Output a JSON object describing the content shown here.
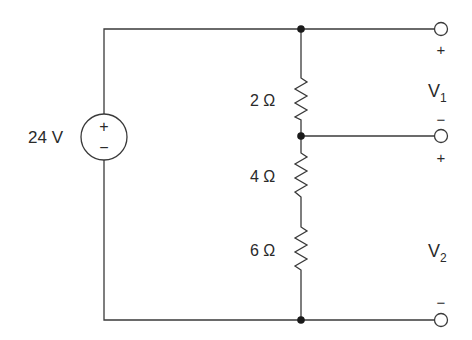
{
  "diagram": {
    "type": "circuit",
    "source": {
      "label": "24 V",
      "plus": "+",
      "minus": "−"
    },
    "resistors": [
      {
        "label": "2 Ω"
      },
      {
        "label": "4 Ω"
      },
      {
        "label": "6 Ω"
      }
    ],
    "outputs": {
      "v1": {
        "name": "V",
        "sub": "1",
        "plus": "+",
        "minus": "−"
      },
      "v2": {
        "name": "V",
        "sub": "2",
        "plus": "+",
        "minus": "−"
      }
    },
    "colors": {
      "wire": "#3a3a3a",
      "text": "#2a2a2a",
      "background": "#ffffff"
    }
  }
}
